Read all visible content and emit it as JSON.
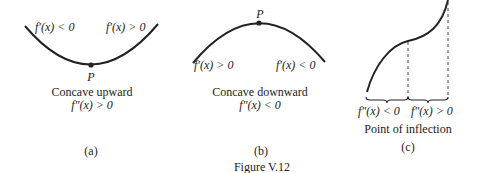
{
  "panels": [
    {
      "id": "a",
      "label": "(a)",
      "left_derivative": "f′(x) < 0",
      "right_derivative": "f′(x) > 0",
      "point_label": "P",
      "caption": "Concave upward",
      "second_derivative": "f″(x) > 0"
    },
    {
      "id": "b",
      "label": "(b)",
      "left_derivative": "f′(x) > 0",
      "right_derivative": "f′(x) < 0",
      "point_label": "P",
      "caption": "Concave downward",
      "second_derivative": "f″(x) < 0"
    },
    {
      "id": "c",
      "label": "(c)",
      "left_second_derivative": "f″(x) < 0",
      "right_second_derivative": "f″(x) > 0",
      "caption": "Point of inflection"
    }
  ],
  "figure_caption": "Figure V.12",
  "colors": {
    "ink": "#222222",
    "background": "#ffffff"
  }
}
